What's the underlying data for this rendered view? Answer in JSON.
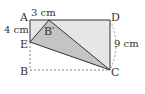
{
  "diagram": {
    "points": {
      "A": "A",
      "B": "B",
      "C": "C",
      "D": "D",
      "E": "E",
      "B_prime": "B′"
    },
    "measurements": {
      "AB_prime": "3 cm",
      "AE": "4 cm",
      "DC": "9 cm"
    },
    "colors": {
      "rect_fill": "#e6e6e6",
      "fold_triangle_fill": "#c4c4c4",
      "stroke": "#333333",
      "dashed": "#666666"
    }
  }
}
